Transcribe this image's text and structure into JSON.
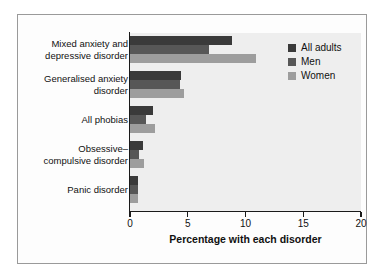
{
  "chart_data": {
    "type": "bar",
    "orientation": "horizontal",
    "title": "",
    "xlabel": "Percentage with each disorder",
    "ylabel": "",
    "xlim": [
      0,
      20
    ],
    "xticks": [
      0,
      5,
      10,
      15,
      20
    ],
    "xticklabels": [
      "0",
      "5",
      "10",
      "15",
      "20"
    ],
    "grid": false,
    "legend_position": "upper right",
    "categories": [
      "Mixed anxiety and\ndepressive disorder",
      "Generalised anxiety\ndisorder",
      "All phobias",
      "Obsessive–\ncompulsive disorder",
      "Panic disorder"
    ],
    "series": [
      {
        "name": "All adults",
        "color": "#3a3a3a",
        "values": [
          8.8,
          4.4,
          2.0,
          1.1,
          0.7
        ]
      },
      {
        "name": "Men",
        "color": "#575757",
        "values": [
          6.8,
          4.3,
          1.4,
          0.8,
          0.7
        ]
      },
      {
        "name": "Women",
        "color": "#9d9d9d",
        "values": [
          10.9,
          4.7,
          2.2,
          1.2,
          0.7
        ]
      }
    ]
  },
  "axis": {
    "tick_labels": [
      "0",
      "5",
      "10",
      "15",
      "20"
    ],
    "x_title": "Percentage with each disorder"
  },
  "legend": {
    "entries": [
      {
        "label": "All adults",
        "color": "#3a3a3a"
      },
      {
        "label": "Men",
        "color": "#575757"
      },
      {
        "label": "Women",
        "color": "#9d9d9d"
      }
    ]
  },
  "category_labels": [
    "Mixed anxiety and\ndepressive disorder",
    "Generalised anxiety\ndisorder",
    "All phobias",
    "Obsessive–\ncompulsive disorder",
    "Panic disorder"
  ],
  "colors": {
    "plot_background": "#eeeeee",
    "figure_background": "#ffffff",
    "frame_border": "#9a9a9a",
    "axis": "#1a1a1a",
    "text": "#111111"
  }
}
